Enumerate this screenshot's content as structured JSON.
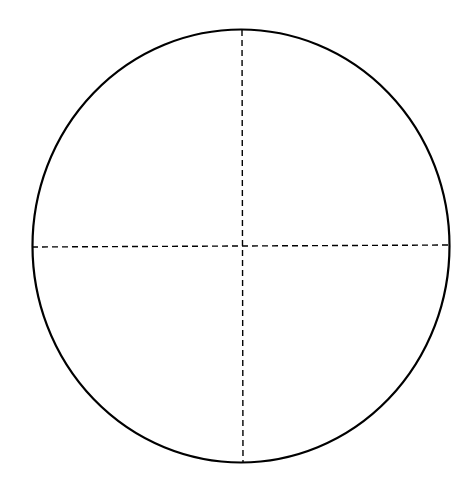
{
  "diagram": {
    "type": "circle-with-crosshair",
    "background": "#ffffff",
    "stroke_color": "#000000",
    "circle": {
      "cx": 241,
      "cy": 246,
      "rx": 208.5,
      "ry": 216.5,
      "stroke_width": 2.2
    },
    "vertical_axis": {
      "x1": 242,
      "y1": 30,
      "x2": 243,
      "y2": 463,
      "style": "dashed",
      "dash": "6 4",
      "stroke_width": 1.4
    },
    "horizontal_axis": {
      "x1": 32,
      "y1": 247,
      "x2": 449,
      "y2": 245,
      "style": "dashed",
      "dash": "6 4",
      "stroke_width": 1.4
    }
  }
}
